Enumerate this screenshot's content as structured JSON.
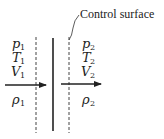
{
  "diagram": {
    "callout": {
      "label": "Control surface"
    },
    "left_state": {
      "pressure": {
        "sym": "p",
        "sub": "1"
      },
      "temperature": {
        "sym": "T",
        "sub": "1"
      },
      "velocity": {
        "sym": "V",
        "sub": "1"
      },
      "density": {
        "sym": "ρ",
        "sub": "1"
      }
    },
    "right_state": {
      "pressure": {
        "sym": "p",
        "sub": "2"
      },
      "temperature": {
        "sym": "T",
        "sub": "2"
      },
      "velocity": {
        "sym": "V",
        "sub": "2"
      },
      "density": {
        "sym": "ρ",
        "sub": "2"
      }
    },
    "colors": {
      "ink": "#222222",
      "background": "#ffffff"
    }
  }
}
